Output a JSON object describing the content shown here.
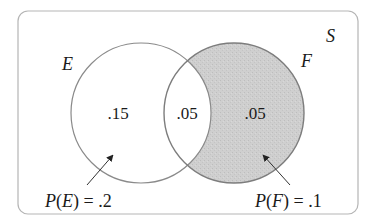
{
  "diagram": {
    "type": "venn",
    "universe_label": "S",
    "sets": [
      {
        "name": "E",
        "label": "E",
        "probability_label": "P(E) = .2",
        "prob_func": "P",
        "prob_set": "E",
        "prob_value": "= .2"
      },
      {
        "name": "F",
        "label": "F",
        "probability_label": "P(F) = .1",
        "prob_func": "P",
        "prob_set": "F",
        "prob_value": "= .1"
      }
    ],
    "regions": {
      "e_only": ".15",
      "e_and_f": ".05",
      "f_only": ".05"
    },
    "shaded_region": "F only (F not E)",
    "colors": {
      "border": "#b5b5b5",
      "circle_stroke": "#8a8a8a",
      "shade_fill": "#cfcfcf",
      "text": "#1a1a1a",
      "arrow": "#333333"
    }
  }
}
